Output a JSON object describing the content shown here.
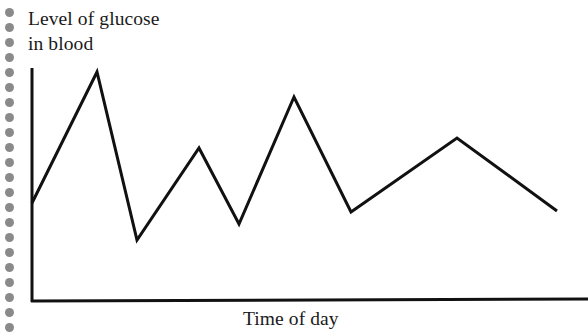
{
  "page": {
    "background_color": "#ffffff",
    "width": 588,
    "height": 334
  },
  "binding": {
    "name": "spiral-binding-holes",
    "color": "#8a8a8a",
    "dot_count": 22,
    "first_dot_y": 8,
    "spacing": 15,
    "center_x": 9,
    "diameter": 9
  },
  "chart_data": {
    "type": "line",
    "title": "",
    "subtitle": "",
    "xlabel": "Time of day",
    "ylabel": "Level of glucose in blood",
    "ylabel_line1": "Level of glucose",
    "ylabel_line2": "in blood",
    "grid": false,
    "legend": null,
    "axis_ticks": false,
    "tick_labels": [],
    "line_color": "#111111",
    "line_width": 3,
    "axis_color": "#111111",
    "axis_width": 3,
    "axis_origin": {
      "x": 32,
      "y": 302
    },
    "axis_y_top": {
      "x": 32,
      "y": 68
    },
    "axis_x_right": {
      "x": 588,
      "y": 299
    },
    "x": [
      0,
      1,
      2,
      3,
      4,
      5,
      6,
      7,
      8
    ],
    "values": [
      43,
      100,
      27,
      68,
      35,
      89,
      39,
      71,
      40
    ],
    "point_labels": [
      "start",
      "peak-1",
      "valley-1",
      "peak-2",
      "valley-2",
      "peak-3",
      "valley-3",
      "peak-4",
      "end"
    ],
    "points_px": [
      {
        "x": 32,
        "y": 203
      },
      {
        "x": 97,
        "y": 72
      },
      {
        "x": 137,
        "y": 240
      },
      {
        "x": 199,
        "y": 148
      },
      {
        "x": 239,
        "y": 224
      },
      {
        "x": 294,
        "y": 97
      },
      {
        "x": 351,
        "y": 212
      },
      {
        "x": 457,
        "y": 138
      },
      {
        "x": 557,
        "y": 211
      }
    ],
    "polyline_points": "32,203 97,72 137,240 199,148 239,224 294,97 351,212 457,138 557,211",
    "xlim": [
      0,
      8
    ],
    "ylim": [
      0,
      110
    ],
    "annotations": []
  }
}
